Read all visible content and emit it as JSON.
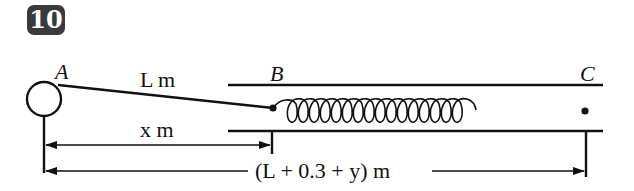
{
  "problem_number": "10",
  "labels": {
    "point_a": "A",
    "point_b": "B",
    "point_c": "C",
    "string_length": "L m",
    "distance_x": "x m",
    "distance_total": "(L + 0.3 + y) m"
  },
  "colors": {
    "badge_bg": "#3a3a3a",
    "line": "#111111"
  }
}
